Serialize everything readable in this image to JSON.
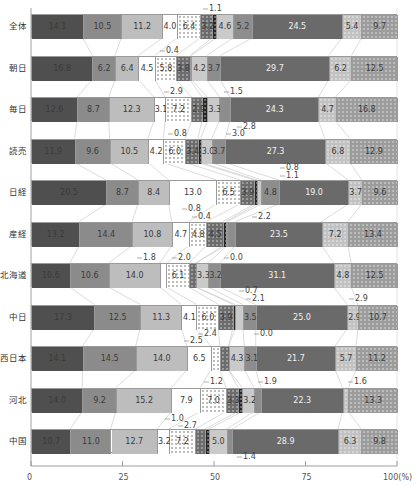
{
  "chart_data": {
    "type": "bar",
    "orientation": "horizontal-stacked-100",
    "title": "",
    "xlabel": "",
    "ylabel": "",
    "xlim": [
      0,
      100
    ],
    "x_ticks": [
      "0",
      "25",
      "50",
      "75",
      "100(%)"
    ],
    "grid": false,
    "legend": null,
    "categories": [
      "全体",
      "朝日",
      "毎日",
      "読売",
      "日経",
      "産経",
      "北海道",
      "中日",
      "西日本",
      "河北",
      "中国"
    ],
    "segment_styles": [
      {
        "fill": "#4f4f4f",
        "pattern": "none",
        "text": "dark"
      },
      {
        "fill": "#8b8b8b",
        "pattern": "none",
        "text": "dark"
      },
      {
        "fill": "#bdbdbd",
        "pattern": "none",
        "text": "dark"
      },
      {
        "fill": "#ffffff",
        "pattern": "none",
        "text": "dark"
      },
      {
        "fill": "#ffffff",
        "pattern": "dots-dark",
        "text": "dark"
      },
      {
        "fill": "#6c6c6c",
        "pattern": "dots",
        "text": "dark"
      },
      {
        "fill": "#262626",
        "pattern": "dots",
        "text": "dark"
      },
      {
        "fill": "#cacaca",
        "pattern": "none",
        "text": "dark"
      },
      {
        "fill": "#8d8d8d",
        "pattern": "none",
        "text": "dark"
      },
      {
        "fill": "#6a6a6a",
        "pattern": "none",
        "text": "light"
      },
      {
        "fill": "#c2c2c2",
        "pattern": "dots",
        "text": "dark"
      },
      {
        "fill": "#9c9c9c",
        "pattern": "dots",
        "text": "dark"
      }
    ],
    "series_values_by_category": [
      [
        14.1,
        10.5,
        11.2,
        4.0,
        6.4,
        3.2,
        1.1,
        4.6,
        5.2,
        24.5,
        5.4,
        9.7
      ],
      [
        16.8,
        6.2,
        6.4,
        4.5,
        5.8,
        3.8,
        0.4,
        4.2,
        3.7,
        29.7,
        6.2,
        12.5
      ],
      [
        12.6,
        8.7,
        12.3,
        3.1,
        7.2,
        2.9,
        1.5,
        3.3,
        2.8,
        24.3,
        4.7,
        16.8
      ],
      [
        11.9,
        9.6,
        10.5,
        4.2,
        6.0,
        3.4,
        0.8,
        3.0,
        3.7,
        27.3,
        6.8,
        12.9
      ],
      [
        20.5,
        8.7,
        8.4,
        13.0,
        6.5,
        3.9,
        0.8,
        1.1,
        4.8,
        19.0,
        3.7,
        9.6
      ],
      [
        13.2,
        14.4,
        10.8,
        4.7,
        4.8,
        4.5,
        0.8,
        0.4,
        2.2,
        23.5,
        7.2,
        13.4
      ],
      [
        10.6,
        10.6,
        14.0,
        1.8,
        6.1,
        2.0,
        0.0,
        3.3,
        3.2,
        31.1,
        4.8,
        12.5
      ],
      [
        17.3,
        12.5,
        11.3,
        4.1,
        6.0,
        3.9,
        0.7,
        2.1,
        3.5,
        25.0,
        2.9,
        10.7
      ],
      [
        14.1,
        14.5,
        14.0,
        6.5,
        2.5,
        2.4,
        0.0,
        4.3,
        3.1,
        21.7,
        5.7,
        11.2
      ],
      [
        14.0,
        9.2,
        15.2,
        7.9,
        7.0,
        3.3,
        1.2,
        3.2,
        1.9,
        22.3,
        1.6,
        13.3
      ],
      [
        10.7,
        11.0,
        12.7,
        3.2,
        7.2,
        2.7,
        1.0,
        5.0,
        1.4,
        28.9,
        6.3,
        9.8
      ]
    ],
    "inline_label_min": 2.9,
    "callouts": [
      {
        "row": 0,
        "text": "1.1",
        "x": 209,
        "y": 4
      },
      {
        "row": 1,
        "text": "0.4",
        "x": 166,
        "y": 46
      },
      {
        "row": 2,
        "text": "2.9",
        "x": 170,
        "y": 87
      },
      {
        "row": 2,
        "text": "1.5",
        "x": 230,
        "y": 87
      },
      {
        "row": 2,
        "text": "2.8",
        "x": 243,
        "y": 122
      },
      {
        "row": 3,
        "text": "0.8",
        "x": 174,
        "y": 129
      },
      {
        "row": 3,
        "text": "3.0",
        "x": 232,
        "y": 129
      },
      {
        "row": 4,
        "text": "0.8",
        "x": 286,
        "y": 163
      },
      {
        "row": 4,
        "text": "1.1",
        "x": 286,
        "y": 171
      },
      {
        "row": 5,
        "text": "0.8",
        "x": 188,
        "y": 204
      },
      {
        "row": 5,
        "text": "0.4",
        "x": 198,
        "y": 212
      },
      {
        "row": 5,
        "text": "2.2",
        "x": 258,
        "y": 212
      },
      {
        "row": 6,
        "text": "1.8",
        "x": 143,
        "y": 253
      },
      {
        "row": 6,
        "text": "2.0",
        "x": 178,
        "y": 253
      },
      {
        "row": 6,
        "text": "0.0",
        "x": 230,
        "y": 253
      },
      {
        "row": 7,
        "text": "0.7",
        "x": 245,
        "y": 286
      },
      {
        "row": 7,
        "text": "2.1",
        "x": 252,
        "y": 294
      },
      {
        "row": 7,
        "text": "2.9",
        "x": 355,
        "y": 294
      },
      {
        "row": 8,
        "text": "2.4",
        "x": 204,
        "y": 329
      },
      {
        "row": 8,
        "text": "0.0",
        "x": 260,
        "y": 329
      },
      {
        "row": 8,
        "text": "2.5",
        "x": 190,
        "y": 336
      },
      {
        "row": 9,
        "text": "1.2",
        "x": 210,
        "y": 377
      },
      {
        "row": 9,
        "text": "1.9",
        "x": 264,
        "y": 377
      },
      {
        "row": 9,
        "text": "1.6",
        "x": 354,
        "y": 377
      },
      {
        "row": 10,
        "text": "1.0",
        "x": 171,
        "y": 414
      },
      {
        "row": 10,
        "text": "2.7",
        "x": 184,
        "y": 421
      },
      {
        "row": 10,
        "text": "1.4",
        "x": 243,
        "y": 452
      }
    ]
  },
  "layout": {
    "plot_left": 31,
    "plot_right": 397,
    "first_bar_top": 14,
    "row_step": 41.5,
    "bar_height": 24,
    "axis_y": 466
  }
}
